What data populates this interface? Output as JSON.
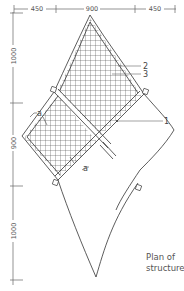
{
  "title": "Plan of structure",
  "caption": {
    "line1": "Plan of",
    "line2": "structure"
  },
  "dimensions": {
    "horizontal": [
      {
        "label": "450"
      },
      {
        "label": "900"
      },
      {
        "label": "450"
      }
    ],
    "vertical": [
      {
        "label": "1000"
      },
      {
        "label": "900"
      },
      {
        "label": "1000"
      }
    ]
  },
  "callouts": [
    {
      "number": "1"
    },
    {
      "number": "2"
    },
    {
      "number": "3"
    }
  ],
  "section_markers": [
    {
      "label": "a"
    },
    {
      "label": "a"
    }
  ],
  "colors": {
    "line": "#333333",
    "dimension": "#666666",
    "hatch": "#444444",
    "background": "#ffffff"
  }
}
